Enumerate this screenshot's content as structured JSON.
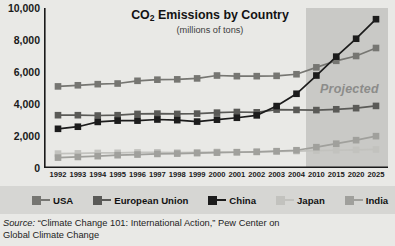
{
  "chart_data": {
    "type": "line",
    "title": "CO2 Emissions by Country",
    "title_main": "CO",
    "title_sub": "2",
    "title_rest": " Emissions by Country",
    "subtitle": "(millions of tons)",
    "xlabel": "",
    "ylabel": "",
    "ylim": [
      0,
      10000
    ],
    "yticks": [
      "0",
      "2,000",
      "4,000",
      "6,000",
      "8,000",
      "10,000"
    ],
    "ytick_values": [
      0,
      2000,
      4000,
      6000,
      8000,
      10000
    ],
    "grid": false,
    "legend_position": "bottom",
    "categories": [
      "1992",
      "1993",
      "1994",
      "1995",
      "1996",
      "1997",
      "1998",
      "1999",
      "2000",
      "2001",
      "2002",
      "2003",
      "2004",
      "2010",
      "2015",
      "2020",
      "2025"
    ],
    "annotations": [
      {
        "text": "Projected",
        "start_category": "2010",
        "note": "shaded band covering 2010-2025"
      }
    ],
    "series": [
      {
        "name": "USA",
        "color": "#767672",
        "values": [
          5100,
          5170,
          5240,
          5280,
          5450,
          5520,
          5540,
          5600,
          5780,
          5740,
          5740,
          5760,
          5860,
          6290,
          6700,
          7000,
          7500
        ]
      },
      {
        "name": "European Union",
        "color": "#5a5a57",
        "values": [
          3300,
          3300,
          3280,
          3300,
          3380,
          3400,
          3380,
          3400,
          3460,
          3500,
          3480,
          3650,
          3630,
          3620,
          3670,
          3740,
          3880
        ]
      },
      {
        "name": "China",
        "color": "#1c1c1c",
        "values": [
          2450,
          2580,
          2880,
          2960,
          2960,
          3030,
          2990,
          2900,
          3020,
          3140,
          3290,
          3870,
          4640,
          5780,
          6960,
          8080,
          9300
        ]
      },
      {
        "name": "Japan",
        "color": "#c2c2be",
        "values": [
          900,
          915,
          940,
          950,
          975,
          980,
          960,
          980,
          1000,
          990,
          1010,
          1030,
          1060,
          1090,
          1110,
          1130,
          1160
        ]
      },
      {
        "name": "India",
        "color": "#a0a09c",
        "values": [
          650,
          690,
          740,
          800,
          840,
          880,
          900,
          930,
          960,
          985,
          1010,
          1050,
          1110,
          1300,
          1520,
          1740,
          1990
        ]
      }
    ]
  },
  "legend": {
    "items": [
      {
        "label": "USA",
        "color": "#767672"
      },
      {
        "label": "European Union",
        "color": "#5a5a57"
      },
      {
        "label": "China",
        "color": "#1c1c1c"
      },
      {
        "label": "Japan",
        "color": "#c2c2be"
      },
      {
        "label": "India",
        "color": "#a0a09c"
      }
    ]
  },
  "projected": {
    "label": "Projected",
    "color": "#8c8c8a"
  },
  "source": {
    "prefix": "Source:",
    "line1": "“Climate Change 101: International Action,” Pew Center on",
    "line2": "Global Climate Change"
  },
  "colors": {
    "panel_background": "#e9e9e6",
    "legend_background": "#d6d6d3",
    "projected_band": "#c9c9c6",
    "axis": "#1a1a1a"
  }
}
